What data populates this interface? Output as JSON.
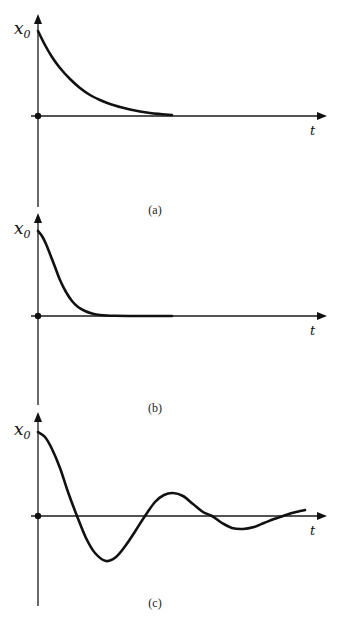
{
  "figure": {
    "panels": [
      {
        "id": "a",
        "caption": "(a)",
        "y_label": "x",
        "y_label_sub": "0",
        "x_label": "t",
        "description": "Overdamped decay: exponential decay from x0 to 0",
        "layout": {
          "axis_x": 38,
          "y_top": 14,
          "y_bottom": 207,
          "origin_y": 116,
          "x0_y": 31,
          "x_end": 327,
          "caption_x": 155,
          "caption_y": 214
        },
        "curve": {
          "points": [
            [
              38,
              31
            ],
            [
              45,
              45
            ],
            [
              52,
              57
            ],
            [
              60,
              68
            ],
            [
              70,
              79
            ],
            [
              80,
              88
            ],
            [
              90,
              95
            ],
            [
              100,
              100
            ],
            [
              110,
              104
            ],
            [
              120,
              107
            ],
            [
              130,
              109.5
            ],
            [
              140,
              111.5
            ],
            [
              150,
              113
            ],
            [
              160,
              114
            ],
            [
              172,
              115
            ]
          ]
        }
      },
      {
        "id": "b",
        "caption": "(b)",
        "y_label": "x",
        "y_label_sub": "0",
        "x_label": "t",
        "description": "Critically damped decay: rapid return to 0 without oscillation",
        "layout": {
          "axis_x": 38,
          "y_top": 213,
          "y_bottom": 405,
          "origin_y": 316,
          "x0_y": 231,
          "x_end": 327,
          "caption_x": 155,
          "caption_y": 412
        },
        "curve": {
          "points": [
            [
              38,
              231
            ],
            [
              42,
              236
            ],
            [
              46,
              244
            ],
            [
              50,
              254
            ],
            [
              55,
              267
            ],
            [
              60,
              280
            ],
            [
              66,
              292
            ],
            [
              72,
              301
            ],
            [
              78,
              307
            ],
            [
              85,
              311
            ],
            [
              92,
              313.5
            ],
            [
              100,
              315
            ],
            [
              115,
              315.8
            ],
            [
              140,
              316
            ],
            [
              172,
              316
            ]
          ]
        }
      },
      {
        "id": "c",
        "caption": "(c)",
        "y_label": "x",
        "y_label_sub": "0",
        "x_label": "t",
        "description": "Underdamped oscillation: decaying sinusoid about 0",
        "layout": {
          "axis_x": 38,
          "y_top": 412,
          "y_bottom": 606,
          "origin_y": 516,
          "x0_y": 432,
          "x_end": 327,
          "caption_x": 155,
          "caption_y": 607
        },
        "curve": {
          "points": [
            [
              38,
              432
            ],
            [
              45,
              437
            ],
            [
              52,
              449
            ],
            [
              60,
              468
            ],
            [
              68,
              492
            ],
            [
              77,
              516
            ],
            [
              86,
              538
            ],
            [
              95,
              553
            ],
            [
              106,
              561
            ],
            [
              116,
              557
            ],
            [
              126,
              545
            ],
            [
              136,
              530
            ],
            [
              145,
              516
            ],
            [
              155,
              502
            ],
            [
              164,
              495
            ],
            [
              173,
              493
            ],
            [
              183,
              496
            ],
            [
              193,
              504
            ],
            [
              203,
              512
            ],
            [
              212,
              516
            ],
            [
              222,
              523
            ],
            [
              232,
              528
            ],
            [
              243,
              529
            ],
            [
              254,
              527
            ],
            [
              264,
              523
            ],
            [
              274,
              519
            ],
            [
              283,
              516
            ],
            [
              292,
              513
            ],
            [
              300,
              511
            ],
            [
              305,
              510
            ]
          ]
        }
      }
    ],
    "colors": {
      "stroke": "#111111",
      "axis": "#1a1a1a",
      "background": "#ffffff"
    }
  }
}
